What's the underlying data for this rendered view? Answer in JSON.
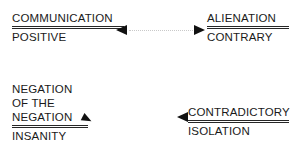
{
  "diagram": {
    "background_color": "#ffffff",
    "text_color": "#1a1a1a",
    "rule_color": "#262626",
    "arrow_color": "#111111",
    "connector_color": "#c9c9c9",
    "terms": [
      {
        "id": "communication-positive",
        "numerator": "COMMUNICATION",
        "denominator": "POSITIVE"
      },
      {
        "id": "alienation-contrary",
        "numerator": "ALIENATION",
        "denominator": "CONTRARY"
      },
      {
        "id": "negation-insanity",
        "numerator_line_1": "NEGATION",
        "numerator_line_2": "OF THE",
        "numerator_line_3": "NEGATION",
        "denominator": "INSANITY"
      },
      {
        "id": "contradictory-isolation",
        "numerator": "CONTRADICTORY",
        "denominator": "ISOLATION"
      }
    ]
  }
}
